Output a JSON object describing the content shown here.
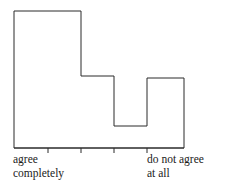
{
  "figure": {
    "type": "histogram-outline",
    "background": "#ffffff",
    "line_color": "#2b2b2b",
    "line_width": 1,
    "text_color": "#1a1a1a"
  },
  "labels": {
    "left": {
      "line1": "agree",
      "line2": "completely"
    },
    "right": {
      "line1": "do not agree",
      "line2": "at all"
    }
  },
  "chart_data": {
    "type": "bar",
    "title": "",
    "xlabel": "",
    "ylabel": "",
    "categories": [
      "agree completely",
      "2",
      "3",
      "4",
      "do not agree at all"
    ],
    "values": [
      137,
      137,
      72,
      22,
      70
    ],
    "ylim": [
      0,
      148
    ],
    "grid": false,
    "legend": null,
    "axis": {
      "baseline_y": 148,
      "left_x": 14,
      "right_x": 184,
      "bin_edges": [
        14,
        48,
        81,
        114,
        147,
        184
      ],
      "tick_positions": [
        48,
        81,
        114,
        147
      ],
      "tick_length": 5
    },
    "bar_tops_y": [
      11,
      11,
      76,
      126,
      78
    ],
    "annotations": [
      {
        "text": "agree completely",
        "position": "below-left-axis"
      },
      {
        "text": "do not agree at all",
        "position": "below-right-axis"
      }
    ]
  }
}
